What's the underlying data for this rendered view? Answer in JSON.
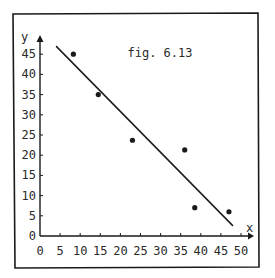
{
  "chart_data": {
    "type": "scatter",
    "title": "fig. 6.13",
    "xlabel": "x",
    "ylabel": "y",
    "xlim": [
      0,
      50
    ],
    "ylim": [
      0,
      48
    ],
    "grid": false,
    "legend": null,
    "x_ticks": [
      0,
      5,
      10,
      15,
      20,
      25,
      30,
      35,
      40,
      45,
      50
    ],
    "y_ticks": [
      0,
      5,
      10,
      15,
      20,
      25,
      30,
      35,
      40,
      45
    ],
    "series": [
      {
        "name": "data points",
        "kind": "scatter",
        "x": [
          8.3,
          14.5,
          23,
          36,
          38.5,
          47
        ],
        "y": [
          45,
          35,
          23.7,
          21.3,
          7,
          6
        ]
      },
      {
        "name": "fitted line",
        "kind": "line",
        "x": [
          4,
          48
        ],
        "y": [
          47,
          2.5
        ]
      }
    ]
  }
}
